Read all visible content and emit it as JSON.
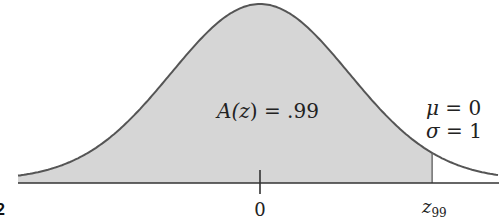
{
  "chart_data": {
    "type": "area",
    "title": "",
    "distribution": {
      "mu": 0,
      "sigma": 1
    },
    "shaded_region": {
      "from": "-inf",
      "to": "z99",
      "area": 0.99
    },
    "annotations": {
      "area_label": "A(z) = .99",
      "mu_label": "μ = 0",
      "sigma_label": "σ = 1"
    },
    "x_ticks": [
      {
        "value": 0,
        "label": "0"
      },
      {
        "value": 2.326,
        "label": "z99"
      }
    ],
    "xlabel": "",
    "ylabel": "",
    "grid": false,
    "colors": {
      "fill": "#d6d6d6",
      "curve": "#555555",
      "axis": "#333333"
    }
  },
  "labels": {
    "area_prefix": "A(",
    "area_var": "z",
    "area_suffix": ") = .99",
    "mu_sym": "μ",
    "mu_rest": " = 0",
    "sigma_sym": "σ",
    "sigma_rest": " = 1",
    "tick_zero": "0",
    "tick_z": "z",
    "tick_z_sub": "99",
    "corner_fragment": "2"
  }
}
